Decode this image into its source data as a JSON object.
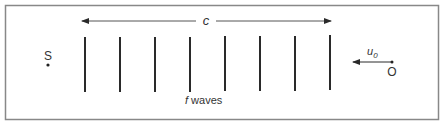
{
  "diagram": {
    "speed_label": "c",
    "source_label": "S",
    "observer_label": "O",
    "observer_velocity_label": "u",
    "observer_velocity_subscript": "0",
    "waves_label_prefix": "f",
    "waves_label_suffix": " waves",
    "wavefront_count": 8,
    "colors": {
      "line": "#2a2a2a",
      "border": "#888888",
      "text": "#333333"
    }
  }
}
